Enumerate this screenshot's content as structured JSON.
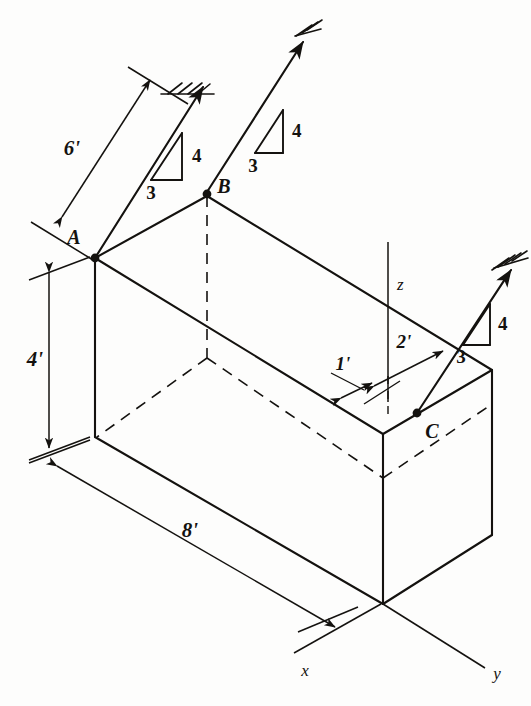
{
  "figure": {
    "background_color": "#fdfdfc",
    "ink_color": "#14120f"
  },
  "points": {
    "a_label": "A",
    "b_label": "B",
    "c_label": "C"
  },
  "axes": {
    "x_label": "x",
    "y_label": "y",
    "z_label": "z"
  },
  "dimensions": {
    "cable_a_length": "6'",
    "box_height": "4'",
    "box_length": "8'",
    "offset_near": "1'",
    "offset_far": "2'"
  },
  "slope_triangles": [
    {
      "id": "cable-a",
      "run": "3",
      "rise": "4"
    },
    {
      "id": "cable-b",
      "run": "3",
      "rise": "4"
    },
    {
      "id": "cable-c",
      "run": "3",
      "rise": "4"
    }
  ],
  "supports": [
    {
      "id": "support-a",
      "type": "fixed-hatched-anchor"
    },
    {
      "id": "support-b",
      "type": "fixed-hatched-anchor"
    },
    {
      "id": "support-c",
      "type": "fixed-hatched-anchor"
    }
  ]
}
